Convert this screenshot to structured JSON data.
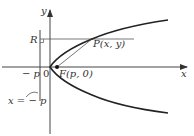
{
  "diagram": {
    "labels": {
      "x_axis": "x",
      "y_axis": "y",
      "origin": "0",
      "neg_p": "− p",
      "R": "R",
      "P": "P(x, y)",
      "F": "F(p, 0)",
      "directrix": "x = − p"
    },
    "colors": {
      "stroke": "#333333",
      "curve": "#222222",
      "background": "#ffffff"
    }
  }
}
